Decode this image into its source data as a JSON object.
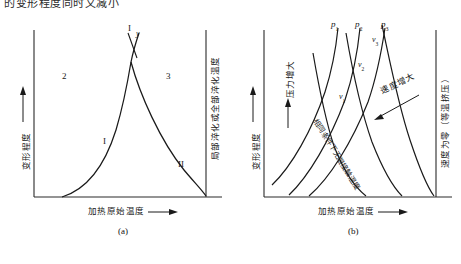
{
  "figure": {
    "top_partial_text": "的变形程度同时又减小",
    "panels": [
      {
        "id": "a",
        "caption": "(a)",
        "x_axis_label": "加热原始温度",
        "x_axis_arrow": "⟶",
        "y_axis_label_left": "变形程度",
        "y_axis_label_right": "局部淬化或全部淬化温度",
        "region_labels": [
          {
            "text": "2"
          },
          {
            "text": "3"
          },
          {
            "text": "I"
          },
          {
            "text": "II"
          }
        ],
        "curve_labels": [
          {
            "text": "I"
          },
          {
            "text": "y"
          }
        ]
      },
      {
        "id": "b",
        "caption": "(b)",
        "x_axis_label": "加热原始温度",
        "x_axis_arrow": "⟶",
        "y_axis_label_left": "变形程度",
        "y_axis_label_right": "速度为零（等温挤压）",
        "pressure_label": "压力增大",
        "speed_label": "速度增大",
        "diagonal_label": "相同条件下无限接触温度",
        "pressure_curves": [
          {
            "text": "p",
            "sub": "1"
          },
          {
            "text": "p",
            "sub": "2"
          },
          {
            "text": "p",
            "sub": "3"
          }
        ],
        "speed_curves": [
          {
            "text": "v",
            "sub": "1"
          },
          {
            "text": "v",
            "sub": "2"
          },
          {
            "text": "v",
            "sub": "3"
          }
        ]
      }
    ],
    "colors": {
      "ink": "#1a1a1a",
      "axis": "#2a2a2a",
      "background": "#ffffff"
    }
  }
}
